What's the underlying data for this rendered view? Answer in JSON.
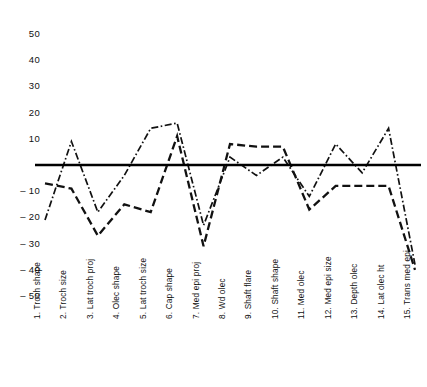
{
  "chart_data": {
    "type": "line",
    "title": "",
    "subtitle": "",
    "xlabel": "",
    "ylabel": "",
    "ylim": [
      -50,
      50
    ],
    "yticks": [
      50,
      40,
      30,
      20,
      10,
      -10,
      -20,
      -30,
      -40,
      -50
    ],
    "ytick_labels": [
      "50",
      "40",
      "30",
      "20",
      "10",
      "– 10",
      "– 20",
      "– 30",
      "– 40",
      "– 50"
    ],
    "grid": false,
    "legend": "none",
    "reference_line": 0,
    "categories": [
      "1. Troch shape",
      "2. Troch size",
      "3. Lat troch proj",
      "4. Olec shape",
      "5. Lat troch size",
      "6. Cap shape",
      "7. Med epi proj",
      "8. Wd olec",
      "9. Shaft flare",
      "10. Shaft shape",
      "11. Med olec",
      "12. Med epi size",
      "13. Depth olec",
      "14. Lat olec ht",
      "15. Trans med epi"
    ],
    "series": [
      {
        "name": "series-dash-dot",
        "style": "dash-dot",
        "values": [
          -21,
          9,
          -18,
          -4,
          14,
          16,
          -23,
          3,
          -4,
          3,
          -12,
          8,
          -3,
          14,
          -38
        ]
      },
      {
        "name": "series-dashed",
        "style": "long-dash",
        "values": [
          -7,
          -9,
          -27,
          -15,
          -18,
          11,
          -31,
          8,
          7,
          7,
          -17,
          -8,
          -8,
          -8,
          -40
        ]
      }
    ]
  }
}
